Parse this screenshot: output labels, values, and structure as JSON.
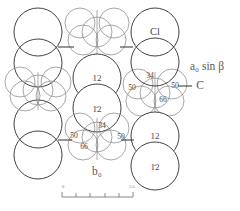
{
  "figure": {
    "type": "crystal-structure-packing-diagram",
    "colors": {
      "large_sphere_outline": "#2e2e2e",
      "small_sphere_outline": "#8a8a8a",
      "label_text": "#4a4a4a",
      "axis_text": "#5a5a5a",
      "scale_text": "#7a7a7a",
      "background": "#ffffff"
    },
    "atom_labels": {
      "chlorine_label": "Cl",
      "carbon_label": "C"
    },
    "axis_labels": {
      "vertical_right": "a₀ sin β",
      "vertical_right_plain": "a0 sin beta",
      "horizontal_bottom": "b₀",
      "horizontal_bottom_plain": "b0"
    },
    "scale_bar": {
      "left_label": "0",
      "right_label": "5A",
      "tick_count": 5
    },
    "large_spheres": [
      {
        "id": "L1",
        "cx": 38,
        "cy": 32,
        "r": 24,
        "label": ""
      },
      {
        "id": "L2",
        "cx": 38,
        "cy": 63,
        "r": 24,
        "label": ""
      },
      {
        "id": "L3",
        "cx": 38,
        "cy": 124,
        "r": 24,
        "label": ""
      },
      {
        "id": "L4",
        "cx": 38,
        "cy": 155,
        "r": 24,
        "label": ""
      },
      {
        "id": "C1",
        "cx": 97,
        "cy": 78,
        "r": 24,
        "label": "12"
      },
      {
        "id": "C2",
        "cx": 97,
        "cy": 108,
        "r": 24,
        "label": "1̄2"
      },
      {
        "id": "R1",
        "cx": 155,
        "cy": 32,
        "r": 24,
        "label": "Cl"
      },
      {
        "id": "R2",
        "cx": 155,
        "cy": 62,
        "r": 24,
        "label": ""
      },
      {
        "id": "R3",
        "cx": 155,
        "cy": 136,
        "r": 24,
        "label": "12"
      },
      {
        "id": "R4",
        "cx": 155,
        "cy": 166,
        "r": 24,
        "label": "1̄2"
      }
    ],
    "carbon_clusters": [
      {
        "id": "cluster-top-center",
        "cx": 97,
        "cy": 33,
        "labels": []
      },
      {
        "id": "cluster-left-middle",
        "cx": 38,
        "cy": 93,
        "labels": []
      },
      {
        "id": "cluster-right-middle",
        "cx": 155,
        "cy": 93,
        "labels": [
          {
            "text": "34",
            "x": 150,
            "y": 76
          },
          {
            "text": "50",
            "x": 132,
            "y": 88
          },
          {
            "text": "50",
            "x": 175,
            "y": 86
          },
          {
            "text": "66",
            "x": 163,
            "y": 100
          }
        ]
      },
      {
        "id": "cluster-bottom-center",
        "cx": 97,
        "cy": 137,
        "labels": [
          {
            "text": "34",
            "x": 102,
            "y": 126
          },
          {
            "text": "50",
            "x": 74,
            "y": 136
          },
          {
            "text": "50",
            "x": 121,
            "y": 137
          },
          {
            "text": "66",
            "x": 84,
            "y": 147
          }
        ]
      }
    ]
  }
}
